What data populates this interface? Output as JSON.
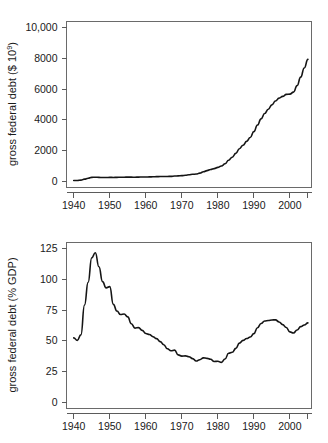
{
  "chart_data": [
    {
      "id": "gross-federal-debt-dollars",
      "type": "line",
      "title": "",
      "xlabel": "",
      "ylabel": "gross federal debt ($ 10",
      "ylabel_exponent": "9",
      "ylabel_suffix": ")",
      "xlim": [
        1938,
        2006
      ],
      "ylim": [
        -400,
        10400
      ],
      "xticks": [
        1940,
        1950,
        1960,
        1970,
        1980,
        1990,
        2000
      ],
      "xticklabels": [
        "1940",
        "1950",
        "1960",
        "1970",
        "1980",
        "1990",
        "2000"
      ],
      "extra_xticks": [
        2005
      ],
      "yticks": [
        0,
        2000,
        4000,
        6000,
        8000,
        10000
      ],
      "yticklabels": [
        "0",
        "2000",
        "4000",
        "6000",
        "8000",
        "10,000"
      ],
      "grid": false,
      "legend": false,
      "line_color": "#151515",
      "x": [
        1940,
        1941,
        1942,
        1943,
        1944,
        1945,
        1946,
        1947,
        1948,
        1949,
        1950,
        1951,
        1952,
        1953,
        1954,
        1955,
        1956,
        1957,
        1958,
        1959,
        1960,
        1961,
        1962,
        1963,
        1964,
        1965,
        1966,
        1967,
        1968,
        1969,
        1970,
        1971,
        1972,
        1973,
        1974,
        1975,
        1976,
        1977,
        1978,
        1979,
        1980,
        1981,
        1982,
        1983,
        1984,
        1985,
        1986,
        1987,
        1988,
        1989,
        1990,
        1991,
        1992,
        1993,
        1994,
        1995,
        1996,
        1997,
        1998,
        1999,
        2000,
        2001,
        2002,
        2003,
        2004,
        2005
      ],
      "values": [
        51,
        58,
        79,
        143,
        204,
        260,
        271,
        257,
        252,
        253,
        257,
        255,
        259,
        266,
        271,
        274,
        273,
        271,
        276,
        285,
        286,
        289,
        298,
        306,
        312,
        317,
        320,
        326,
        348,
        354,
        371,
        398,
        427,
        458,
        475,
        533,
        620,
        699,
        772,
        827,
        908,
        998,
        1142,
        1377,
        1572,
        1823,
        2125,
        2350,
        2602,
        2857,
        3233,
        3665,
        4065,
        4411,
        4693,
        4974,
        5225,
        5413,
        5526,
        5656,
        5674,
        5807,
        6228,
        6783,
        7379,
        7933
      ],
      "annotations": []
    },
    {
      "id": "gross-federal-debt-pct-gdp",
      "type": "line",
      "title": "",
      "xlabel": "",
      "ylabel": "gross federal debt (% GDP)",
      "xlim": [
        1938,
        2006
      ],
      "ylim": [
        -5,
        130
      ],
      "xticks": [
        1940,
        1950,
        1960,
        1970,
        1980,
        1990,
        2000
      ],
      "xticklabels": [
        "1940",
        "1950",
        "1960",
        "1970",
        "1980",
        "1990",
        "2000"
      ],
      "extra_xticks": [
        2005
      ],
      "yticks": [
        0,
        25,
        50,
        75,
        100,
        125
      ],
      "yticklabels": [
        "0",
        "25",
        "50",
        "75",
        "100",
        "125"
      ],
      "grid": false,
      "legend": false,
      "line_color": "#151515",
      "x": [
        1940,
        1941,
        1942,
        1943,
        1944,
        1945,
        1946,
        1947,
        1948,
        1949,
        1950,
        1951,
        1952,
        1953,
        1954,
        1955,
        1956,
        1957,
        1958,
        1959,
        1960,
        1961,
        1962,
        1963,
        1964,
        1965,
        1966,
        1967,
        1968,
        1969,
        1970,
        1971,
        1972,
        1973,
        1974,
        1975,
        1976,
        1977,
        1978,
        1979,
        1980,
        1981,
        1982,
        1983,
        1984,
        1985,
        1986,
        1987,
        1988,
        1989,
        1990,
        1991,
        1992,
        1993,
        1994,
        1995,
        1996,
        1997,
        1998,
        1999,
        2000,
        2001,
        2002,
        2003,
        2004,
        2005
      ],
      "values": [
        52.4,
        50.4,
        54.9,
        79.1,
        97.6,
        117.5,
        121.7,
        110.3,
        98.2,
        93.1,
        94.1,
        79.7,
        74.3,
        71.4,
        71.8,
        69.5,
        63.9,
        60.4,
        60.8,
        58.5,
        56.0,
        55.2,
        53.4,
        51.8,
        49.4,
        46.9,
        43.6,
        42.0,
        42.5,
        38.6,
        37.6,
        37.8,
        37.1,
        35.6,
        33.6,
        34.7,
        36.2,
        35.8,
        35.0,
        33.2,
        33.4,
        32.5,
        35.3,
        39.9,
        40.7,
        43.9,
        48.2,
        50.4,
        51.9,
        53.1,
        55.9,
        60.7,
        64.1,
        66.1,
        66.6,
        67.0,
        67.1,
        65.4,
        63.2,
        60.9,
        57.3,
        56.4,
        58.8,
        61.6,
        62.9,
        64.6
      ],
      "annotations": []
    }
  ]
}
